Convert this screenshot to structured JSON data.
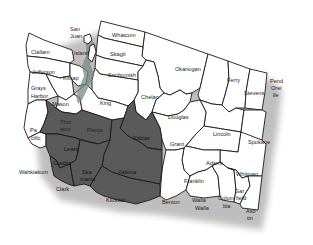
{
  "map": {
    "title": "Washington State Counties",
    "colors": {
      "plain": "#ffffff",
      "shaded": "#5a5a5a",
      "border": "#1a1a1a",
      "shadow": "#8a8a8a"
    },
    "counties": [
      {
        "id": "whatcom",
        "label": "Whatcom",
        "shaded": false
      },
      {
        "id": "san-juan",
        "label": "San Juan",
        "shaded": false
      },
      {
        "id": "island",
        "label": "Island",
        "shaded": false
      },
      {
        "id": "skagit",
        "label": "Skagit",
        "shaded": false
      },
      {
        "id": "clallam",
        "label": "Clallam",
        "shaded": false
      },
      {
        "id": "jefferson",
        "label": "Jefferson",
        "shaded": false
      },
      {
        "id": "kitsap",
        "label": "Kitsap",
        "shaded": false
      },
      {
        "id": "snohomish",
        "label": "Snohomish",
        "shaded": false
      },
      {
        "id": "grays-harbor",
        "label": "Grays Harbor",
        "shaded": false
      },
      {
        "id": "mason",
        "label": "Mason",
        "shaded": false
      },
      {
        "id": "king",
        "label": "King",
        "shaded": false
      },
      {
        "id": "chelan",
        "label": "Chelan",
        "shaded": false
      },
      {
        "id": "okanogan",
        "label": "Okanogan",
        "shaded": false
      },
      {
        "id": "ferry",
        "label": "Ferry",
        "shaded": false
      },
      {
        "id": "stevens",
        "label": "Stevens",
        "shaded": false
      },
      {
        "id": "pend-oreille",
        "label": "Pend Oreille",
        "shaded": false
      },
      {
        "id": "douglas",
        "label": "Douglas",
        "shaded": false
      },
      {
        "id": "lincoln",
        "label": "Lincoln",
        "shaded": false
      },
      {
        "id": "spokane",
        "label": "Spokane",
        "shaded": false
      },
      {
        "id": "thurston",
        "label": "Thurston",
        "shaded": false
      },
      {
        "id": "pierce",
        "label": "Pierce",
        "shaded": false
      },
      {
        "id": "kittitas",
        "label": "Kittitas",
        "shaded": true
      },
      {
        "id": "grant",
        "label": "Grant",
        "shaded": false
      },
      {
        "id": "pacific",
        "label": "Pacific",
        "shaded": false
      },
      {
        "id": "lewis",
        "label": "Lewis",
        "shaded": true
      },
      {
        "id": "adams",
        "label": "Adams",
        "shaded": false
      },
      {
        "id": "whitman",
        "label": "Whitman",
        "shaded": false
      },
      {
        "id": "wahkiakum",
        "label": "Wahkiakum",
        "shaded": false
      },
      {
        "id": "cowlitz",
        "label": "Cowlitz",
        "shaded": true
      },
      {
        "id": "skamania",
        "label": "Skamania",
        "shaded": true
      },
      {
        "id": "yakima",
        "label": "Yakima",
        "shaded": true
      },
      {
        "id": "franklin",
        "label": "Franklin",
        "shaded": false
      },
      {
        "id": "clark",
        "label": "Clark",
        "shaded": true
      },
      {
        "id": "klickitat",
        "label": "Klickitat",
        "shaded": true
      },
      {
        "id": "benton",
        "label": "Benton",
        "shaded": false
      },
      {
        "id": "walla-walla",
        "label": "Walla Walla",
        "shaded": false
      },
      {
        "id": "columbia",
        "label": "Columbia",
        "shaded": false
      },
      {
        "id": "garfield",
        "label": "Garfield",
        "shaded": false
      },
      {
        "id": "asotin",
        "label": "Asotin",
        "shaded": false
      }
    ],
    "labels": {
      "whatcom": "Whatcom",
      "san_juan_1": "San",
      "san_juan_2": "Juan",
      "island": "Island",
      "skagit": "Skagit",
      "clallam": "Clallam",
      "jefferson": "Jefferson",
      "kitsap": "Kitsap",
      "snohomish": "Snohomish",
      "grays_harbor_1": "Grays",
      "grays_harbor_2": "Harbor",
      "mason": "Mason",
      "king": "King",
      "chelan": "Chelan",
      "okanogan": "Okanogan",
      "ferry": "Ferry",
      "stevens": "Stevens",
      "pend_oreille_1": "Pend",
      "pend_oreille_2": "Orei",
      "pend_oreille_3": "lle",
      "douglas": "Douglas",
      "lincoln": "Lincoln",
      "spokane": "Spokane",
      "thurston_1": "Thur",
      "thurston_2": "ston",
      "pierce": "Pierce",
      "kittitas": "Kittitas",
      "grant": "Grant",
      "pacific_1": "Pa",
      "pacific_2": "cific",
      "lewis": "Lewis",
      "adams": "Adams",
      "whitman": "Whitman",
      "wahkiakum": "Wahkiakum",
      "cowlitz": "Cowlitz",
      "skamania_1": "Ska",
      "skamania_2": "mania",
      "yakima": "Yakima",
      "franklin": "Franklin",
      "clark": "Clark",
      "klickitat": "Klickitat",
      "benton": "Benton",
      "walla_walla_1": "Walla",
      "walla_walla_2": "Walla",
      "columbia_1": "Colum",
      "columbia_2": "bia",
      "garfield_1": "Gar",
      "garfield_2": "field",
      "asotin_1": "Aso",
      "asotin_2": "tin"
    }
  }
}
